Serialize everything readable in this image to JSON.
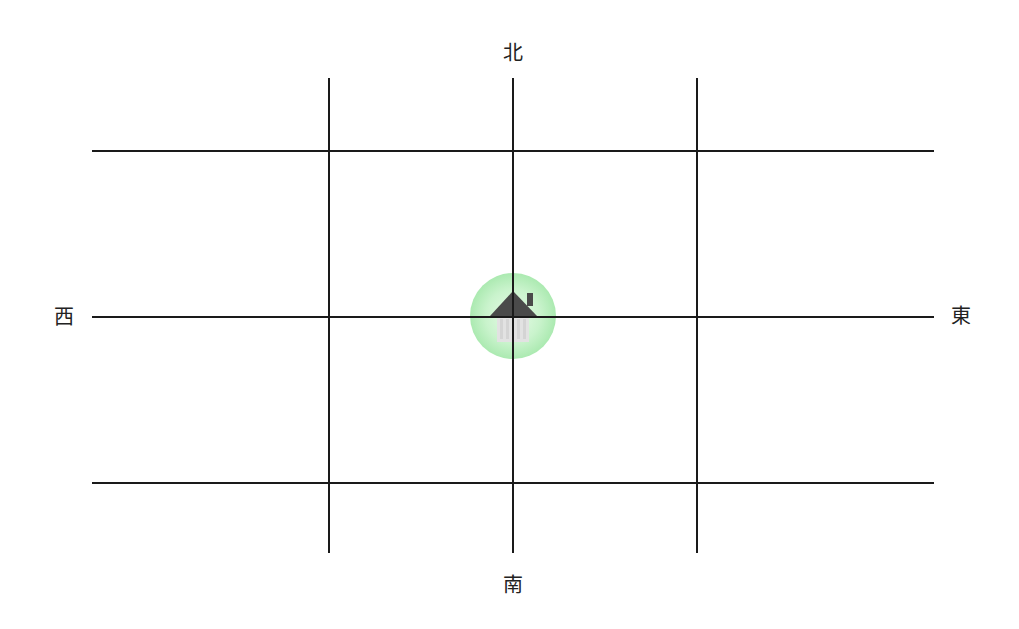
{
  "diagram": {
    "type": "grid-compass-map",
    "directions": {
      "north": "北",
      "south": "南",
      "east": "東",
      "west": "西"
    },
    "grid": {
      "horizontal_lines_y": [
        151,
        317,
        483
      ],
      "vertical_lines_x": [
        329,
        513,
        697
      ],
      "h_extent": [
        92,
        934
      ],
      "v_extent": [
        78,
        553
      ],
      "line_color": "#1a1a1a"
    },
    "marker": {
      "icon": "house-icon",
      "center": [
        513,
        316
      ],
      "glow_color": "#a6e8ac",
      "roof_color": "#4a4a4a",
      "body_color": "#e0e0e0"
    }
  }
}
